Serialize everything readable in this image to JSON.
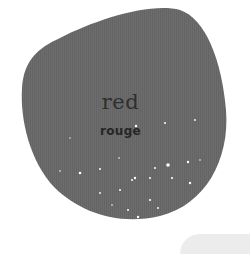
{
  "card": {
    "word": "red",
    "translation": "rouge",
    "blob_color": "#6b6b6b",
    "speckle_color": "#ffffff"
  }
}
